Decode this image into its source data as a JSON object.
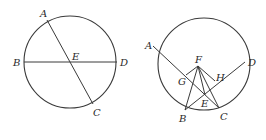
{
  "figures": [
    {
      "name": "left",
      "circle": {
        "cx": 70,
        "cy": 62,
        "r": 46
      },
      "points": {
        "A": {
          "x": 47,
          "y": 20,
          "lx": 40,
          "ly": 17
        },
        "B": {
          "x": 24,
          "y": 62,
          "lx": 13,
          "ly": 66
        },
        "C": {
          "x": 93,
          "y": 104,
          "lx": 93,
          "ly": 116
        },
        "D": {
          "x": 117,
          "y": 62,
          "lx": 120,
          "ly": 66
        },
        "E": {
          "x": 71,
          "y": 62,
          "lx": 72,
          "ly": 60
        }
      },
      "segments": [
        [
          "A",
          "C"
        ],
        [
          "B",
          "D"
        ]
      ]
    },
    {
      "name": "right",
      "circle": {
        "cx": 204,
        "cy": 64,
        "r": 46
      },
      "points": {
        "A": {
          "x": 153,
          "y": 46,
          "lx": 145,
          "ly": 49
        },
        "B": {
          "x": 185,
          "y": 110,
          "lx": 179,
          "ly": 122
        },
        "C": {
          "x": 219,
          "y": 108,
          "lx": 220,
          "ly": 120
        },
        "D": {
          "x": 245,
          "y": 62,
          "lx": 248,
          "ly": 66
        },
        "E": {
          "x": 205,
          "y": 95,
          "lx": 201,
          "ly": 107
        },
        "F": {
          "x": 198,
          "y": 66,
          "lx": 195,
          "ly": 63
        },
        "G": {
          "x": 186,
          "y": 75,
          "lx": 178,
          "ly": 85
        },
        "H": {
          "x": 215,
          "y": 81,
          "lx": 216,
          "ly": 81
        }
      },
      "segments": [
        [
          "A",
          "C"
        ],
        [
          "B",
          "D"
        ],
        [
          "F",
          "B"
        ],
        [
          "F",
          "G"
        ],
        [
          "F",
          "E"
        ],
        [
          "F",
          "C"
        ],
        [
          "F",
          "H"
        ]
      ]
    }
  ],
  "labels": {
    "left": {
      "A": "A",
      "B": "B",
      "C": "C",
      "D": "D",
      "E": "E"
    },
    "right": {
      "A": "A",
      "B": "B",
      "C": "C",
      "D": "D",
      "E": "E",
      "F": "F",
      "G": "G",
      "H": "H"
    }
  }
}
